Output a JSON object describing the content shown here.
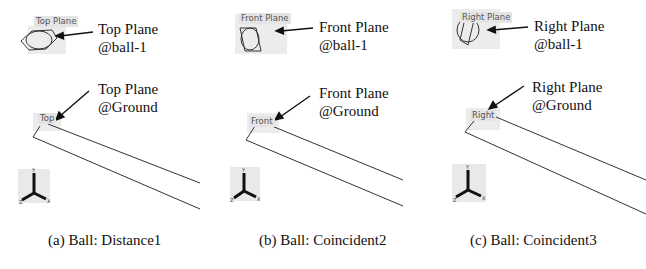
{
  "figure": {
    "panels": [
      {
        "id": "a",
        "caption": "(a) Ball: Distance1",
        "ball_plane_tag": "Top Plane",
        "ball_callout_line1": "Top Plane",
        "ball_callout_line2": "@ball-1",
        "ground_plane_tag": "Top",
        "ground_callout_line1": "Top Plane",
        "ground_callout_line2": "@Ground"
      },
      {
        "id": "b",
        "caption": "(b) Ball: Coincident2",
        "ball_plane_tag": "Front Plane",
        "ball_callout_line1": "Front Plane",
        "ball_callout_line2": "@ball-1",
        "ground_plane_tag": "Front",
        "ground_callout_line1": "Front Plane",
        "ground_callout_line2": "@Ground"
      },
      {
        "id": "c",
        "caption": "(c) Ball: Coincident3",
        "ball_plane_tag": "Right Plane",
        "ball_callout_line1": "Right Plane",
        "ball_callout_line2": "@ball-1",
        "ground_plane_tag": "Right",
        "ground_callout_line1": "Right Plane",
        "ground_callout_line2": "@Ground"
      }
    ],
    "triad_axes": {
      "x": "X",
      "y": "Y",
      "z": "Z"
    }
  }
}
